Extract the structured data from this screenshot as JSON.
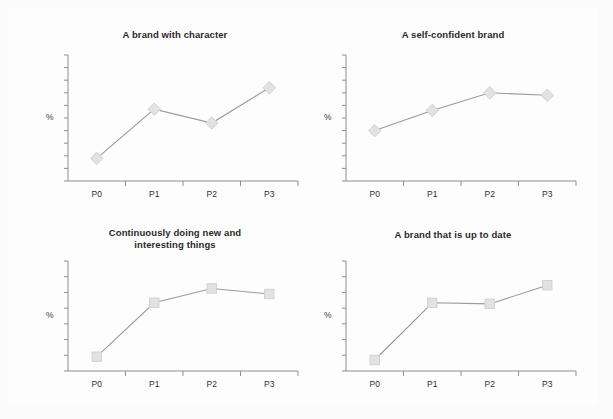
{
  "page": {
    "background_color": "#fbfbfb",
    "panel_color": "#fdfdfd"
  },
  "style": {
    "line_color": "#9a9a9a",
    "marker_fill": "#e2e2e2",
    "marker_stroke": "#d2d2d2",
    "axis_color": "#8f8f8f",
    "title_color": "#2a2a2a"
  },
  "charts": [
    {
      "id": "a-brand-with-character",
      "title": "A brand with character",
      "title_lines": [
        "A brand with character"
      ],
      "ylabel": "%",
      "marker": "diamond",
      "categories": [
        "P0",
        "P1",
        "P2",
        "P3"
      ],
      "values": [
        18,
        57,
        46,
        74
      ],
      "y_ticks": 10
    },
    {
      "id": "a-self-confident-brand",
      "title": "A self-confident brand",
      "title_lines": [
        "A self-confident brand"
      ],
      "ylabel": "%",
      "marker": "diamond",
      "categories": [
        "P0",
        "P1",
        "P2",
        "P3"
      ],
      "values": [
        40,
        56,
        70,
        68
      ],
      "y_ticks": 10
    },
    {
      "id": "continuously-doing-new-and-interesting-things",
      "title": "Continuously doing new and interesting things",
      "title_lines": [
        "Continuously doing new and",
        "interesting things"
      ],
      "ylabel": "%",
      "marker": "square",
      "categories": [
        "P0",
        "P1",
        "P2",
        "P3"
      ],
      "values": [
        13,
        62,
        75,
        70
      ],
      "y_ticks": 7
    },
    {
      "id": "a-brand-that-is-up-to-date",
      "title": "A brand that is up to date",
      "title_lines": [
        "A brand that is up to date"
      ],
      "ylabel": "%",
      "marker": "square",
      "categories": [
        "P0",
        "P1",
        "P2",
        "P3"
      ],
      "values": [
        10,
        62,
        61,
        78
      ],
      "y_ticks": 7
    }
  ],
  "chart_data": {
    "type": "line",
    "xlabel": "",
    "ylabel": "%",
    "x": [
      "P0",
      "P1",
      "P2",
      "P3"
    ],
    "grid": false,
    "legend": "none",
    "axis_tick_labels_y": [],
    "panels": [
      {
        "title": "A brand with character",
        "marker": "diamond",
        "categories": [
          "P0",
          "P1",
          "P2",
          "P3"
        ],
        "values": [
          18,
          57,
          46,
          74
        ],
        "ylim": [
          0,
          100
        ]
      },
      {
        "title": "A self-confident brand",
        "marker": "diamond",
        "categories": [
          "P0",
          "P1",
          "P2",
          "P3"
        ],
        "values": [
          40,
          56,
          70,
          68
        ],
        "ylim": [
          0,
          100
        ]
      },
      {
        "title": "Continuously doing new and interesting things",
        "marker": "square",
        "categories": [
          "P0",
          "P1",
          "P2",
          "P3"
        ],
        "values": [
          13,
          62,
          75,
          70
        ],
        "ylim": [
          0,
          100
        ]
      },
      {
        "title": "A brand that is up to date",
        "marker": "square",
        "categories": [
          "P0",
          "P1",
          "P2",
          "P3"
        ],
        "values": [
          10,
          62,
          61,
          78
        ],
        "ylim": [
          0,
          100
        ]
      }
    ]
  }
}
